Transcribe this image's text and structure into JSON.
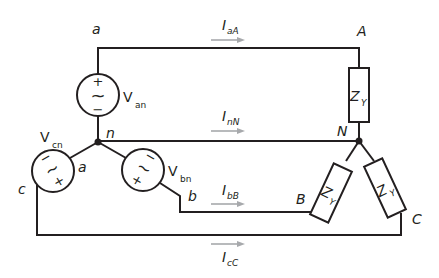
{
  "diagram": {
    "source_nodes": {
      "a": "a",
      "b": "b",
      "c": "c",
      "n": "n",
      "a_inner": "a"
    },
    "load_nodes": {
      "A": "A",
      "B": "B",
      "C": "C",
      "N": "N"
    },
    "sources": [
      {
        "id": "Van",
        "main": "V",
        "sub": "an",
        "plus": "+",
        "minus": "−",
        "symbol": "~"
      },
      {
        "id": "Vbn",
        "main": "V",
        "sub": "bn",
        "plus": "×",
        "minus": "'",
        "symbol": "S"
      },
      {
        "id": "Vcn",
        "main": "V",
        "sub": "cn",
        "plus": "×",
        "minus": "'",
        "symbol": "2"
      }
    ],
    "impedances": [
      {
        "id": "ZA",
        "main": "Z",
        "sub": "Y"
      },
      {
        "id": "ZB",
        "main": "Z",
        "sub": "Y"
      },
      {
        "id": "ZC",
        "main": "Z",
        "sub": "Y"
      }
    ],
    "currents": [
      {
        "id": "IaA",
        "main": "I",
        "sub": "aA"
      },
      {
        "id": "InN",
        "main": "I",
        "sub": "nN"
      },
      {
        "id": "IbB",
        "main": "I",
        "sub": "bB"
      },
      {
        "id": "IcC",
        "main": "I",
        "sub": "cC"
      }
    ],
    "colors": {
      "wire": "#231f20",
      "arrow": "#a7a9ac",
      "background": "#ffffff"
    }
  }
}
